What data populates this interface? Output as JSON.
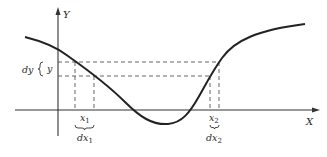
{
  "diagram": {
    "axes": {
      "y_label": "Y",
      "x_label": "X"
    },
    "labels": {
      "dy": "dy",
      "y": "y",
      "x1": "x",
      "x1_sub": "1",
      "dx1": "dx",
      "dx1_sub": "1",
      "x2": "x",
      "x2_sub": "2",
      "dx2": "dx",
      "dx2_sub": "2"
    }
  }
}
